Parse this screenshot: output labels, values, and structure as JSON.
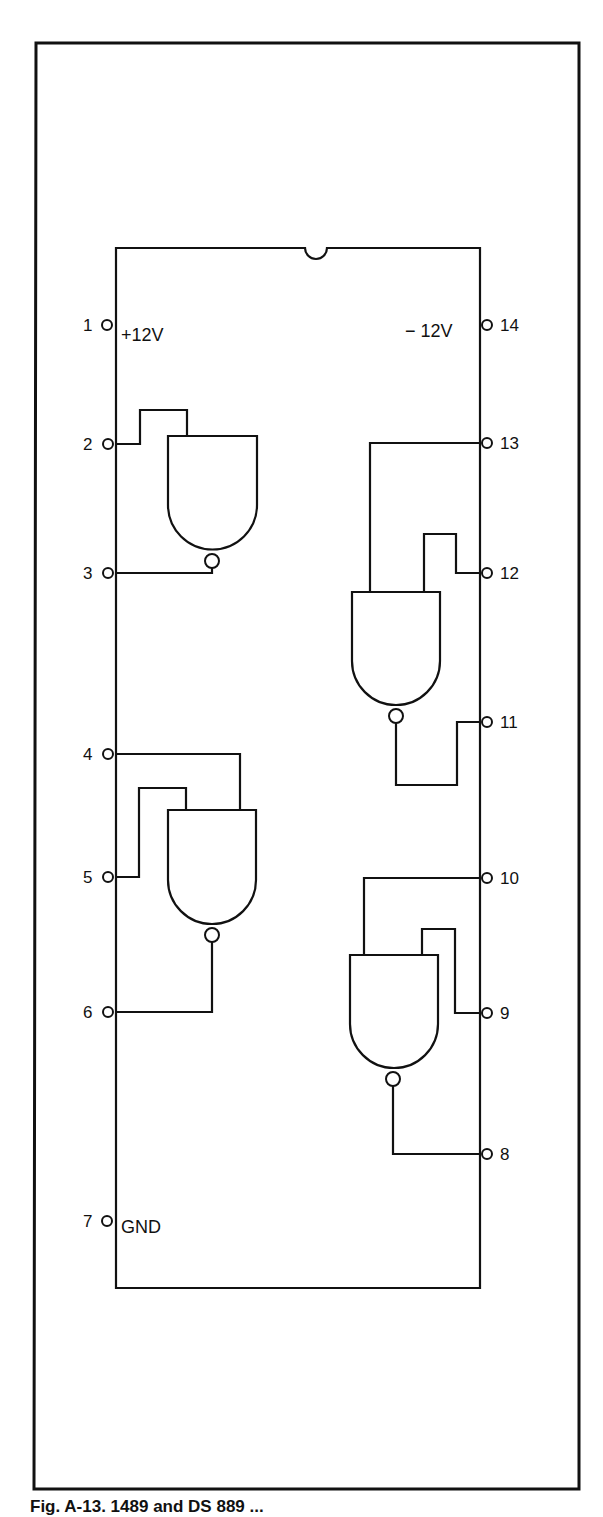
{
  "figure": {
    "caption": "Fig. A-13. 1489 and DS 889 ...",
    "chip": {
      "type": "14-pin DIP, quad NAND gate",
      "pins_left": [
        {
          "number": "1",
          "signal": "+12V"
        },
        {
          "number": "2",
          "signal": ""
        },
        {
          "number": "3",
          "signal": ""
        },
        {
          "number": "4",
          "signal": ""
        },
        {
          "number": "5",
          "signal": ""
        },
        {
          "number": "6",
          "signal": ""
        },
        {
          "number": "7",
          "signal": "GND"
        }
      ],
      "pins_right": [
        {
          "number": "14",
          "signal": "-12V"
        },
        {
          "number": "13",
          "signal": ""
        },
        {
          "number": "12",
          "signal": ""
        },
        {
          "number": "11",
          "signal": ""
        },
        {
          "number": "10",
          "signal": ""
        },
        {
          "number": "9",
          "signal": ""
        },
        {
          "number": "8",
          "signal": ""
        }
      ],
      "labels": {
        "vplus": "+12V",
        "vminus": "− 12V",
        "gnd": "GND"
      },
      "gates": [
        {
          "name": "gate-1",
          "inputs": [
            "2"
          ],
          "output": "3"
        },
        {
          "name": "gate-2",
          "inputs": [
            "4",
            "5"
          ],
          "output": "6"
        },
        {
          "name": "gate-3",
          "inputs": [
            "13",
            "12"
          ],
          "output": "11"
        },
        {
          "name": "gate-4",
          "inputs": [
            "10",
            "9"
          ],
          "output": "8"
        }
      ]
    },
    "colors": {
      "ink": "#111111",
      "paper": "#ffffff"
    }
  }
}
